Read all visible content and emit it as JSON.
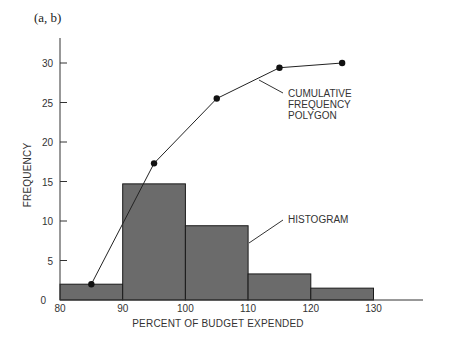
{
  "panel_label": "(a, b)",
  "chart_data": {
    "type": "bar",
    "subtype": "histogram with cumulative frequency polygon",
    "title": "",
    "xlabel": "PERCENT OF BUDGET EXPENDED",
    "ylabel": "FREQUENCY",
    "xlim": [
      80,
      135
    ],
    "ylim": [
      0,
      32
    ],
    "x_ticks": [
      80,
      90,
      100,
      110,
      120,
      130
    ],
    "y_ticks": [
      0,
      5,
      10,
      15,
      20,
      25,
      30
    ],
    "grid": false,
    "histogram": {
      "name": "HISTOGRAM",
      "bins": [
        [
          80,
          90
        ],
        [
          90,
          100
        ],
        [
          100,
          110
        ],
        [
          110,
          120
        ],
        [
          120,
          130
        ]
      ],
      "values": [
        2,
        14.7,
        9.4,
        3.3,
        1.5
      ],
      "color": "#6b6b6b"
    },
    "cumulative_polygon": {
      "name": "CUMULATIVE FREQUENCY POLYGON",
      "x": [
        85,
        95,
        105,
        115,
        125
      ],
      "y": [
        2,
        17.3,
        25.5,
        29.4,
        30
      ]
    },
    "annotations": [
      {
        "text": [
          "CUMULATIVE",
          "FREQUENCY",
          "POLYGON"
        ],
        "points_to": "cumulative_polygon"
      },
      {
        "text": [
          "HISTOGRAM"
        ],
        "points_to": "histogram"
      }
    ]
  }
}
